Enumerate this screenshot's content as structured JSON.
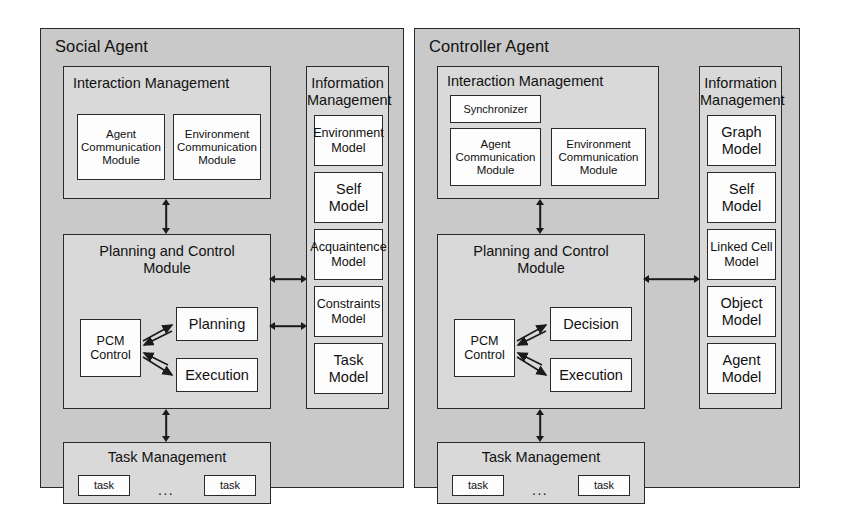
{
  "diagram": {
    "panels": [
      {
        "id": "social-agent",
        "title": "Social Agent",
        "interaction_management": {
          "title": "Interaction Management",
          "synchronizer": null,
          "modules": [
            "Agent\nCommunication\nModule",
            "Environment\nCommunication\nModule"
          ]
        },
        "planning_and_control": {
          "title": "Planning and Control\nModule",
          "control": "PCM\nControl",
          "nodes": [
            "Planning",
            "Execution"
          ]
        },
        "information_management": {
          "title": "Information\nManagement",
          "models": [
            "Environment\nModel",
            "Self\nModel",
            "Acquaintence\nModel",
            "Constraints\nModel",
            "Task\nModel"
          ]
        },
        "task_management": {
          "title": "Task Management",
          "tasks": [
            "task",
            "task"
          ],
          "ellipsis": "..."
        }
      },
      {
        "id": "controller-agent",
        "title": "Controller Agent",
        "interaction_management": {
          "title": "Interaction Management",
          "synchronizer": "Synchronizer",
          "modules": [
            "Agent\nCommunication\nModule",
            "Environment\nCommunication\nModule"
          ]
        },
        "planning_and_control": {
          "title": "Planning and Control\nModule",
          "control": "PCM\nControl",
          "nodes": [
            "Decision",
            "Execution"
          ]
        },
        "information_management": {
          "title": "Information\nManagement",
          "models": [
            "Graph\nModel",
            "Self\nModel",
            "Linked Cell\nModel",
            "Object\nModel",
            "Agent\nModel"
          ]
        },
        "task_management": {
          "title": "Task Management",
          "tasks": [
            "task",
            "task"
          ],
          "ellipsis": "..."
        }
      }
    ],
    "colors": {
      "panel_fill": "#c9c9c9",
      "group_fill": "#d9d9d9",
      "box_fill": "#fdfdfd",
      "stroke": "#2a2a2a",
      "page": "#ffffff"
    }
  }
}
